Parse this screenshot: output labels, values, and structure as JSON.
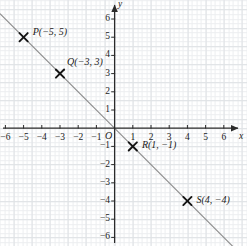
{
  "figure": {
    "kind": "coordinate-plane-line-graph",
    "origin_label": "O",
    "x_axis_label": "x",
    "y_axis_label": "y",
    "grid": "on",
    "line_color": "#8e8e8e",
    "axis_color": "#2b2b2b",
    "grid_color": "#dfe2e5",
    "grid_minor_color": "#eceef0",
    "background": "#ffffff"
  },
  "chart_data": {
    "type": "scatter",
    "title": "",
    "xlabel": "x",
    "ylabel": "y",
    "xlim": [
      -6.6,
      7.2
    ],
    "ylim": [
      -6.5,
      6.8
    ],
    "grid": true,
    "legend": "none",
    "x_ticks": [
      -6,
      -5,
      -4,
      -3,
      -2,
      -1,
      1,
      2,
      3,
      4,
      5,
      6
    ],
    "y_ticks": [
      -6,
      -5,
      -4,
      -3,
      -2,
      -1,
      1,
      2,
      3,
      4,
      5,
      6
    ],
    "x_tick_labels": [
      "−6",
      "−5",
      "−4",
      "−3",
      "−2",
      "−1",
      "1",
      "2",
      "3",
      "4",
      "5",
      "6"
    ],
    "y_tick_labels": [
      "−6",
      "−5",
      "−4",
      "−3",
      "−2",
      "−1",
      "1",
      "2",
      "3",
      "4",
      "5",
      "6"
    ],
    "series": [
      {
        "name": "plotted-points",
        "marker": "x",
        "points": [
          {
            "id": "P",
            "x": -5,
            "y": 5,
            "label": "P(−5, 5)"
          },
          {
            "id": "Q",
            "x": -3,
            "y": 3,
            "label": "Q(−3, 3)"
          },
          {
            "id": "R",
            "x": 1,
            "y": -1,
            "label": "R(1, −1)"
          },
          {
            "id": "S",
            "x": 4,
            "y": -4,
            "label": "S(4, −4)"
          }
        ]
      },
      {
        "name": "fitted-line",
        "type": "line",
        "equation": "y = -x",
        "slope": -1,
        "intercept": 0,
        "from": {
          "x": -6.3,
          "y": 6.3
        },
        "to": {
          "x": 6.5,
          "y": -6.5
        }
      }
    ]
  },
  "ticks": {
    "x": [
      {
        "value": -6,
        "text": "−6"
      },
      {
        "value": -5,
        "text": "−5"
      },
      {
        "value": -4,
        "text": "−4"
      },
      {
        "value": -3,
        "text": "−3"
      },
      {
        "value": -2,
        "text": "−2"
      },
      {
        "value": -1,
        "text": "−1"
      },
      {
        "value": 1,
        "text": "1"
      },
      {
        "value": 2,
        "text": "2"
      },
      {
        "value": 3,
        "text": "3"
      },
      {
        "value": 4,
        "text": "4"
      },
      {
        "value": 5,
        "text": "5"
      },
      {
        "value": 6,
        "text": "6"
      }
    ],
    "y": [
      {
        "value": 6,
        "text": "6"
      },
      {
        "value": 5,
        "text": "5"
      },
      {
        "value": 4,
        "text": "4"
      },
      {
        "value": 3,
        "text": "3"
      },
      {
        "value": 2,
        "text": "2"
      },
      {
        "value": 1,
        "text": "1"
      },
      {
        "value": -1,
        "text": "−1"
      },
      {
        "value": -2,
        "text": "−2"
      },
      {
        "value": -3,
        "text": "−3"
      },
      {
        "value": -4,
        "text": "−4"
      },
      {
        "value": -5,
        "text": "−5"
      },
      {
        "value": -6,
        "text": "−6"
      }
    ]
  },
  "point_labels": {
    "P": "P(−5, 5)",
    "Q": "Q(−3, 3)",
    "R": "R(1, −1)",
    "S": "S(4, −4)"
  }
}
